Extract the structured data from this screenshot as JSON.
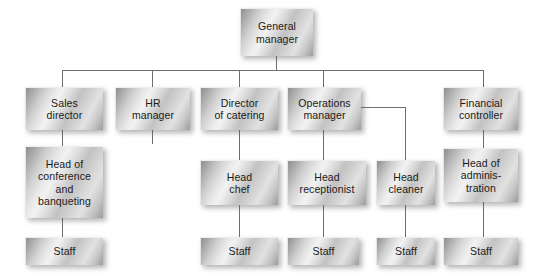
{
  "chart_meta": {
    "type": "organization-chart",
    "title": "Hotel organisational structure",
    "levels": 4,
    "node_count": 16,
    "line_color": "#6e6e6e",
    "box_fill_light": "#f2f2f2",
    "box_fill_dark": "#8f8f8f",
    "text_color": "#1a1a1a",
    "background": "#ffffff"
  },
  "nodes": {
    "general_manager": {
      "label": "General\nmanager",
      "line1": "General",
      "line2": "manager",
      "level": 1
    },
    "sales_director": {
      "label": "Sales\ndirector",
      "line1": "Sales",
      "line2": "director",
      "level": 2
    },
    "hr_manager": {
      "label": "HR\nmanager",
      "line1": "HR",
      "line2": "manager",
      "level": 2
    },
    "director_of_catering": {
      "label": "Director\nof catering",
      "line1": "Director",
      "line2": "of catering",
      "level": 2
    },
    "operations_manager": {
      "label": "Operations\nmanager",
      "line1": "Operations",
      "line2": "manager",
      "level": 2
    },
    "financial_controller": {
      "label": "Financial\ncontroller",
      "line1": "Financial",
      "line2": "controller",
      "level": 2
    },
    "head_of_conference": {
      "label": "Head of\nconference\nand\nbanqueting",
      "line1": "Head of",
      "line2": "conference",
      "line3": "and",
      "line4": "banqueting",
      "level": 3
    },
    "head_chef": {
      "label": "Head\nchef",
      "line1": "Head",
      "line2": "chef",
      "level": 3
    },
    "head_receptionist": {
      "label": "Head\nreceptionist",
      "line1": "Head",
      "line2": "receptionist",
      "level": 3
    },
    "head_cleaner": {
      "label": "Head\ncleaner",
      "line1": "Head",
      "line2": "cleaner",
      "level": 3
    },
    "head_of_administration": {
      "label": "Head of\nadminis-\ntration",
      "line1": "Head of",
      "line2": "adminis-",
      "line3": "tration",
      "level": 3
    },
    "staff_conference": {
      "label": "Staff",
      "level": 4
    },
    "staff_catering": {
      "label": "Staff",
      "level": 4
    },
    "staff_reception": {
      "label": "Staff",
      "level": 4
    },
    "staff_cleaning": {
      "label": "Staff",
      "level": 4
    },
    "staff_administration": {
      "label": "Staff",
      "level": 4
    }
  },
  "edges": [
    {
      "from": "general_manager",
      "to": "sales_director"
    },
    {
      "from": "general_manager",
      "to": "hr_manager"
    },
    {
      "from": "general_manager",
      "to": "director_of_catering"
    },
    {
      "from": "general_manager",
      "to": "operations_manager"
    },
    {
      "from": "general_manager",
      "to": "financial_controller"
    },
    {
      "from": "sales_director",
      "to": "head_of_conference"
    },
    {
      "from": "director_of_catering",
      "to": "head_chef"
    },
    {
      "from": "operations_manager",
      "to": "head_receptionist"
    },
    {
      "from": "operations_manager",
      "to": "head_cleaner"
    },
    {
      "from": "financial_controller",
      "to": "head_of_administration"
    },
    {
      "from": "head_of_conference",
      "to": "staff_conference"
    },
    {
      "from": "head_chef",
      "to": "staff_catering"
    },
    {
      "from": "head_receptionist",
      "to": "staff_reception"
    },
    {
      "from": "head_cleaner",
      "to": "staff_cleaning"
    },
    {
      "from": "head_of_administration",
      "to": "staff_administration"
    }
  ]
}
